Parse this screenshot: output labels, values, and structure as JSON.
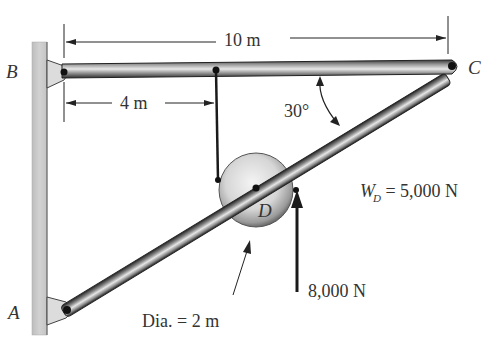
{
  "points": {
    "A": "A",
    "B": "B",
    "C": "C",
    "D": "D"
  },
  "dimensions": {
    "bc_length": "10 m",
    "rope_offset": "4 m",
    "angle": "30°",
    "pulley_diameter": "Dia. = 2 m"
  },
  "loads": {
    "weight_label_main": "W",
    "weight_label_sub": "D",
    "weight_value": " = 5,000 N",
    "applied_force": "8,000 N"
  },
  "colors": {
    "wall": "#c8c8c8",
    "member_dark": "#4a4a4a",
    "member_light": "#d8d8d8",
    "pulley": "#d4d4d4",
    "text": "#333333",
    "line": "#222222"
  }
}
